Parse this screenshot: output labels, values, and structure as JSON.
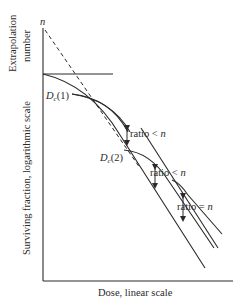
{
  "figure": {
    "extrapolation_label_line1": "Extrapolation",
    "extrapolation_label_line2": "number",
    "n_marker": "n",
    "y_axis_label": "Surviving fraction, logarithmic scale",
    "x_axis_label": "Dose, linear scale",
    "dc1_label": "D",
    "dc1_sub": "c",
    "dc1_suffix": "(1)",
    "dc2_label": "D",
    "dc2_sub": "c",
    "dc2_suffix": "(2)",
    "ratio1": "ratio < ",
    "ratio1_n": "n",
    "ratio2": "ratio < ",
    "ratio2_n": "n",
    "ratio3": "ratio = ",
    "ratio3_n": "n",
    "line_color": "#2a2a2a"
  }
}
